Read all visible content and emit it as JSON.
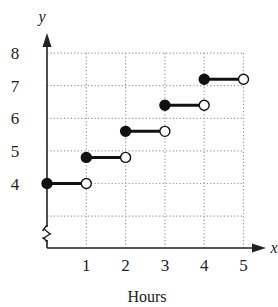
{
  "chart_data": {
    "type": "line",
    "subtype": "step-function",
    "title": "",
    "xlabel": "Hours",
    "ylabel": "",
    "x_axis_letter": "x",
    "y_axis_letter": "y",
    "x_ticks": [
      "1",
      "2",
      "3",
      "4",
      "5"
    ],
    "y_ticks": [
      "4",
      "5",
      "6",
      "7",
      "8"
    ],
    "xlim": [
      0,
      5
    ],
    "ylim": [
      3,
      8
    ],
    "y_axis_break": true,
    "grid": "dotted",
    "legend": null,
    "segments": [
      {
        "x_start": 0,
        "x_end": 1,
        "y": 4.0,
        "start": "closed",
        "end": "open"
      },
      {
        "x_start": 1,
        "x_end": 2,
        "y": 4.8,
        "start": "closed",
        "end": "open"
      },
      {
        "x_start": 2,
        "x_end": 3,
        "y": 5.6,
        "start": "closed",
        "end": "open"
      },
      {
        "x_start": 3,
        "x_end": 4,
        "y": 6.4,
        "start": "closed",
        "end": "open"
      },
      {
        "x_start": 4,
        "x_end": 5,
        "y": 7.2,
        "start": "closed",
        "end": "open"
      }
    ],
    "colors": {
      "line": "#111111",
      "grid": "#999999",
      "axis": "#222222"
    }
  }
}
